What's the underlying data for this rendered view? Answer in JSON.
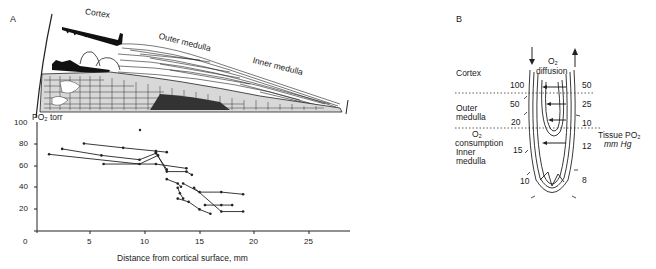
{
  "panel_a": {
    "letter": "A",
    "anatomy_labels": {
      "cortex": "Cortex",
      "outer_medulla": "Outer medulla",
      "inner_medulla": "Inner medulla"
    }
  },
  "panel_b": {
    "letter": "B",
    "zones": {
      "cortex": "Cortex",
      "outer_medulla_1": "Outer",
      "outer_medulla_2": "medulla",
      "o2_consumption_1": "O₂",
      "o2_consumption_2": "consumption",
      "inner_medulla_1": "Inner",
      "inner_medulla_2": "medulla"
    },
    "diffusion_1": "O₂",
    "diffusion_2": "diffusion",
    "descending_values": [
      "100",
      "50",
      "20",
      "15",
      "10"
    ],
    "ascending_values": [
      "50",
      "25",
      "10",
      "12",
      "8"
    ],
    "tissue_label_1": "Tissue PO₂",
    "tissue_label_2": "mm Hg"
  },
  "chart_data": {
    "type": "line",
    "title": "",
    "xlabel": "Distance from cortical surface, mm",
    "ylabel": "PO₂ torr",
    "xlim": [
      0,
      28
    ],
    "ylim": [
      0,
      100
    ],
    "x_ticks": [
      "0",
      "5",
      "10",
      "15",
      "20",
      "25"
    ],
    "y_ticks": [
      "20",
      "40",
      "60",
      "80",
      "100"
    ],
    "grid": false,
    "legend": null,
    "series": [
      {
        "name": "trace-1",
        "x": [
          1.2,
          9.5,
          11.2
        ],
        "y": [
          71,
          62,
          70
        ]
      },
      {
        "name": "trace-2",
        "x": [
          2.4,
          6,
          9.5,
          11,
          12
        ],
        "y": [
          76,
          70,
          66,
          72,
          57
        ]
      },
      {
        "name": "trace-3",
        "x": [
          4.4,
          8,
          11,
          12
        ],
        "y": [
          81,
          77,
          74,
          73
        ]
      },
      {
        "name": "trace-4",
        "x": [
          6.2,
          11,
          13.8
        ],
        "y": [
          62,
          62,
          58
        ]
      },
      {
        "name": "trace-5",
        "x": [
          11,
          12,
          13.8,
          14.3
        ],
        "y": [
          73,
          55,
          55,
          52
        ]
      },
      {
        "name": "trace-6",
        "x": [
          12,
          13,
          13.3
        ],
        "y": [
          48,
          44,
          41
        ]
      },
      {
        "name": "trace-7",
        "x": [
          13.5,
          15,
          17,
          19
        ],
        "y": [
          44,
          36,
          36,
          34
        ]
      },
      {
        "name": "trace-8",
        "x": [
          13,
          13.2,
          13.5
        ],
        "y": [
          40,
          35,
          30
        ]
      },
      {
        "name": "trace-9",
        "x": [
          13,
          14,
          15,
          16
        ],
        "y": [
          30,
          27,
          20,
          16
        ]
      },
      {
        "name": "trace-10",
        "x": [
          14.5,
          17,
          19
        ],
        "y": [
          40,
          18,
          18
        ]
      },
      {
        "name": "trace-11",
        "x": [
          15.5,
          17,
          18
        ],
        "y": [
          24,
          24,
          24
        ]
      }
    ]
  }
}
